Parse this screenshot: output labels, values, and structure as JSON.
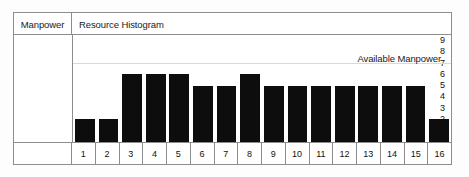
{
  "header": {
    "left_label": "Manpower",
    "title": "Resource Histogram"
  },
  "annotation": {
    "available_manpower_label": "Available Manpower",
    "available_manpower_value": 7
  },
  "colors": {
    "bar": "#0d0d0d",
    "frame": "#8d8d8d",
    "reference_line": "#d9d9d9",
    "background": "#ffffff",
    "text": "#111111"
  },
  "chart_data": {
    "type": "bar",
    "title": "Resource Histogram",
    "xlabel": "",
    "ylabel": "Manpower",
    "ylim": [
      0,
      9.5
    ],
    "yticks": [
      9,
      8,
      7,
      6,
      5,
      4,
      3,
      2,
      1
    ],
    "grid": false,
    "legend": false,
    "categories": [
      "1",
      "2",
      "3",
      "4",
      "5",
      "6",
      "7",
      "8",
      "9",
      "10",
      "11",
      "12",
      "13",
      "14",
      "15",
      "16"
    ],
    "values": [
      2,
      2,
      6,
      6,
      6,
      5,
      5,
      6,
      5,
      5,
      5,
      5,
      5,
      5,
      5,
      2
    ],
    "annotations": [
      {
        "type": "hline",
        "label": "Available Manpower",
        "y": 7
      }
    ]
  }
}
